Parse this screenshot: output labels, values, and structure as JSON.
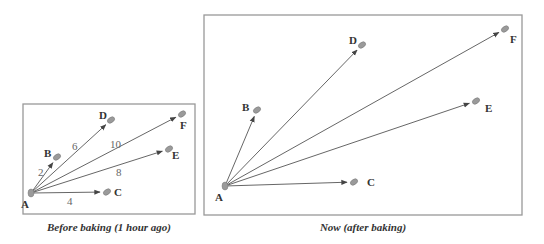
{
  "panels": [
    {
      "id": "before",
      "caption": "Before baking (1 hour ago)",
      "box": {
        "x": 23,
        "y": 104,
        "w": 172,
        "h": 110
      },
      "origin": {
        "label": "A",
        "x": 31,
        "y": 193
      },
      "points": [
        {
          "label": "B",
          "x": 57,
          "y": 157,
          "lx": 44,
          "ly": 157,
          "dist": "2",
          "dx": 38,
          "dy": 176
        },
        {
          "label": "C",
          "x": 107,
          "y": 192,
          "lx": 114,
          "ly": 196,
          "dist": "4",
          "dx": 67,
          "dy": 205
        },
        {
          "label": "D",
          "x": 111,
          "y": 120,
          "lx": 99,
          "ly": 119,
          "dist": "6",
          "dx": 72,
          "dy": 150
        },
        {
          "label": "E",
          "x": 169,
          "y": 149,
          "lx": 172,
          "ly": 159,
          "dist": "8",
          "dx": 116,
          "dy": 176
        },
        {
          "label": "F",
          "x": 182,
          "y": 114,
          "lx": 180,
          "ly": 129,
          "dist": "10",
          "dx": 110,
          "dy": 148
        }
      ]
    },
    {
      "id": "after",
      "caption": "Now (after baking)",
      "box": {
        "x": 204,
        "y": 15,
        "w": 318,
        "h": 200
      },
      "origin": {
        "label": "A",
        "x": 225,
        "y": 186
      },
      "points": [
        {
          "label": "B",
          "x": 257,
          "y": 110,
          "lx": 242,
          "ly": 111,
          "dist": ""
        },
        {
          "label": "C",
          "x": 354,
          "y": 182,
          "lx": 367,
          "ly": 186,
          "dist": ""
        },
        {
          "label": "D",
          "x": 362,
          "y": 45,
          "lx": 349,
          "ly": 44,
          "dist": ""
        },
        {
          "label": "E",
          "x": 476,
          "y": 101,
          "lx": 485,
          "ly": 112,
          "dist": ""
        },
        {
          "label": "F",
          "x": 505,
          "y": 29,
          "lx": 510,
          "ly": 43,
          "dist": ""
        }
      ]
    }
  ],
  "colors": {
    "line": "#555555",
    "dot": "#9a9a9a",
    "box": "#999999",
    "text": "#333333",
    "dist": "#666666"
  }
}
